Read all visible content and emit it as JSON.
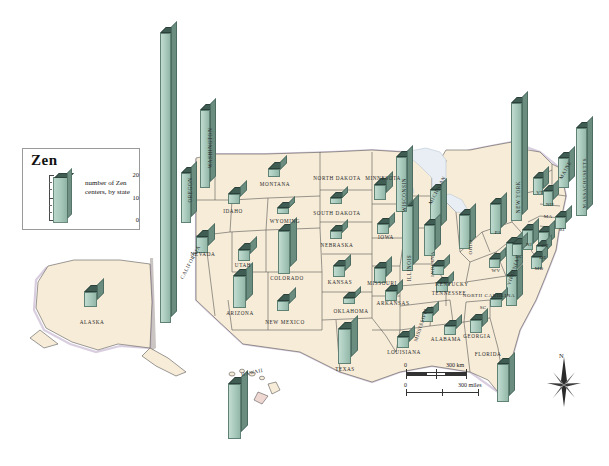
{
  "legend": {
    "title": "Zen",
    "caption": "number of Zen centers, by state",
    "axis_labels": [
      "20",
      "10",
      "0"
    ],
    "axis_max": 20,
    "bar_color": "#a9cbbd",
    "top_color": "#3f5d52"
  },
  "scale": {
    "km_zero": "0",
    "km_label": "300 km",
    "miles_zero": "0",
    "miles_label": "300 miles"
  },
  "compass": {
    "north": "N"
  },
  "chart_data": {
    "type": "bar",
    "title": "Zen",
    "subtitle": "number of Zen centers, by state",
    "ylabel": "number of Zen centers",
    "ylim": [
      0,
      20
    ],
    "categories": [
      "CALIFORNIA",
      "NEW YORK",
      "MASSACHUSETTS",
      "WASHINGTON",
      "OREGON",
      "HAWAII",
      "ILLINOIS",
      "TEXAS",
      "FLORIDA",
      "COLORADO",
      "WISCONSIN",
      "MICHIGAN",
      "PENNSYLVANIA",
      "VIRGINIA",
      "NORTH CAROLINA",
      "ARIZONA",
      "NEW JERSEY",
      "OHIO",
      "MINNESOTA",
      "CONNECTICUT",
      "MAINE",
      "NEVADA",
      "MISSOURI",
      "NEW MEXICO",
      "INDIANA",
      "MARYLAND",
      "LOUISIANA",
      "GEORGIA",
      "ALABAMA",
      "TENNESSEE",
      "KENTUCKY",
      "IOWA",
      "ARKANSAS",
      "MISSISSIPPI",
      "OKLAHOMA",
      "KANSAS",
      "NEBRASKA",
      "SOUTH DAKOTA",
      "MONTANA",
      "IDAHO",
      "UTAH",
      "WYOMING",
      "ALASKA",
      "VERMONT",
      "NEW HAMPSHIRE",
      "RHODE ISLAND",
      "DELAWARE",
      "DISTRICT OF COLUMBIA",
      "WEST VIRGINIA",
      "SOUTH CAROLINA",
      "NORTH DAKOTA"
    ],
    "values": [
      20,
      19,
      16,
      10,
      8,
      12,
      12,
      9,
      8,
      8,
      9,
      7,
      7,
      7,
      7,
      6,
      5,
      5,
      4,
      4,
      5,
      3,
      3,
      2,
      3,
      3,
      3,
      3,
      2,
      2,
      2,
      2,
      2,
      2,
      1,
      2,
      2,
      1,
      1,
      2,
      2,
      1,
      2,
      3,
      3,
      2,
      1,
      2,
      1,
      2,
      0
    ],
    "state_abbrevs": {
      "PENNSYLVANIA": "PA",
      "NEW JERSEY": "NJ",
      "CONNECTICUT": "CT",
      "RHODE ISLAND": "RI",
      "VERMONT": "VT",
      "NEW HAMPSHIRE": "NH",
      "MASSACHUSETTS": "MA",
      "MARYLAND": "MD",
      "DELAWARE": "DE",
      "DISTRICT OF COLUMBIA": "DC",
      "WEST VIRGINIA": "WV",
      "SOUTH CAROLINA": "SC"
    }
  },
  "map": {
    "labels": [
      {
        "name": "WASHINGTON",
        "text": "WASHINGTON",
        "x": 210,
        "y": 148,
        "rot": -90,
        "size": 5.2
      },
      {
        "name": "OREGON",
        "text": "OREGON",
        "x": 190,
        "y": 190,
        "rot": -90,
        "size": 5.2
      },
      {
        "name": "CALIFORNIA",
        "text": "CALIFORNIA",
        "x": 190,
        "y": 262,
        "rot": -62,
        "size": 5.2
      },
      {
        "name": "NEVADA",
        "text": "NEVADA",
        "x": 203,
        "y": 254,
        "rot": 0,
        "size": 5.2
      },
      {
        "name": "IDAHO",
        "text": "IDAHO",
        "x": 233,
        "y": 211,
        "rot": 0,
        "size": 5.2
      },
      {
        "name": "MONTANA",
        "text": "MONTANA",
        "x": 275,
        "y": 184,
        "rot": 0,
        "size": 5.2
      },
      {
        "name": "WYOMING",
        "text": "WYOMING",
        "x": 285,
        "y": 221,
        "rot": 0,
        "size": 5.2
      },
      {
        "name": "UTAH",
        "text": "UTAH",
        "x": 243,
        "y": 265,
        "rot": 0,
        "size": 5.2
      },
      {
        "name": "COLORADO",
        "text": "COLORADO",
        "x": 287,
        "y": 278,
        "rot": 0,
        "size": 5.2
      },
      {
        "name": "ARIZONA",
        "text": "ARIZONA",
        "x": 240,
        "y": 313,
        "rot": 0,
        "size": 5.2
      },
      {
        "name": "NEW-MEXICO",
        "text": "NEW MEXICO",
        "x": 285,
        "y": 322,
        "rot": 0,
        "size": 5.2
      },
      {
        "name": "NORTH-DAKOTA",
        "text": "NORTH DAKOTA",
        "x": 337,
        "y": 178,
        "rot": 0,
        "size": 5.2
      },
      {
        "name": "SOUTH-DAKOTA",
        "text": "SOUTH DAKOTA",
        "x": 337,
        "y": 213,
        "rot": 0,
        "size": 5.2
      },
      {
        "name": "NEBRASKA",
        "text": "NEBRASKA",
        "x": 337,
        "y": 245,
        "rot": 0,
        "size": 5.2
      },
      {
        "name": "KANSAS",
        "text": "KANSAS",
        "x": 340,
        "y": 282,
        "rot": 0,
        "size": 5.2
      },
      {
        "name": "OKLAHOMA",
        "text": "OKLAHOMA",
        "x": 351,
        "y": 311,
        "rot": 0,
        "size": 5.2
      },
      {
        "name": "TEXAS",
        "text": "TEXAS",
        "x": 345,
        "y": 369,
        "rot": 0,
        "size": 5.2
      },
      {
        "name": "MINNESOTA",
        "text": "MINNESOTA",
        "x": 383,
        "y": 178,
        "rot": 0,
        "size": 5.2
      },
      {
        "name": "IOWA",
        "text": "IOWA",
        "x": 386,
        "y": 237,
        "rot": 0,
        "size": 5.2
      },
      {
        "name": "MISSOURI",
        "text": "MISSOURI",
        "x": 382,
        "y": 283,
        "rot": 0,
        "size": 5.2
      },
      {
        "name": "ARKANSAS",
        "text": "ARKANSAS",
        "x": 393,
        "y": 303,
        "rot": 0,
        "size": 5.2
      },
      {
        "name": "LOUISIANA",
        "text": "LOUISIANA",
        "x": 404,
        "y": 352,
        "rot": 0,
        "size": 5.2
      },
      {
        "name": "MISSISSIPPI",
        "text": "MISSISSIPPI",
        "x": 421,
        "y": 325,
        "rot": -72,
        "size": 5
      },
      {
        "name": "ALABAMA",
        "text": "ALABAMA",
        "x": 446,
        "y": 339,
        "rot": 0,
        "size": 5.2
      },
      {
        "name": "GEORGIA",
        "text": "GEORGIA",
        "x": 477,
        "y": 336,
        "rot": 0,
        "size": 5.2
      },
      {
        "name": "FLORIDA",
        "text": "FLORIDA",
        "x": 488,
        "y": 354,
        "rot": 0,
        "size": 5.2
      },
      {
        "name": "TENNESSEE",
        "text": "TENNESSEE",
        "x": 449,
        "y": 293,
        "rot": 0,
        "size": 5.2
      },
      {
        "name": "KENTUCKY",
        "text": "KENTUCKY",
        "x": 452,
        "y": 284,
        "rot": 0,
        "size": 5.2
      },
      {
        "name": "ILLINOIS",
        "text": "ILLINOIS",
        "x": 409,
        "y": 268,
        "rot": -90,
        "size": 5.2
      },
      {
        "name": "WISCONSIN",
        "text": "WISCONSIN",
        "x": 404,
        "y": 195,
        "rot": -90,
        "size": 5.2
      },
      {
        "name": "MICHIGAN",
        "text": "MICHIGAN",
        "x": 437,
        "y": 190,
        "rot": -62,
        "size": 5.2
      },
      {
        "name": "INDIANA",
        "text": "INDIANA",
        "x": 432,
        "y": 264,
        "rot": -90,
        "size": 5
      },
      {
        "name": "OHIO",
        "text": "OHIO",
        "x": 470,
        "y": 247,
        "rot": -90,
        "size": 5
      },
      {
        "name": "NORTH-CAROLINA",
        "text": "NORTH CAROLINA",
        "x": 489,
        "y": 295,
        "rot": 0,
        "size": 5
      },
      {
        "name": "VIRGINIA",
        "text": "VIRGINIA",
        "x": 513,
        "y": 272,
        "rot": -72,
        "size": 5
      },
      {
        "name": "NEW-YORK",
        "text": "NEW YORK",
        "x": 518,
        "y": 197,
        "rot": -90,
        "size": 5.2
      },
      {
        "name": "MAINE",
        "text": "MAINE",
        "x": 565,
        "y": 170,
        "rot": -62,
        "size": 5.2
      },
      {
        "name": "MASSACHUSETTS",
        "text": "MASSACHUSETTS",
        "x": 584,
        "y": 183,
        "rot": -90,
        "size": 5
      },
      {
        "name": "ALASKA",
        "text": "ALASKA",
        "x": 92,
        "y": 322,
        "rot": 0,
        "size": 5.2
      },
      {
        "name": "HAWAII",
        "text": "HAWAII",
        "x": 252,
        "y": 372,
        "rot": -12,
        "size": 5.2
      }
    ],
    "abbrev_labels": [
      {
        "name": "PA",
        "text": "PA",
        "x": 498,
        "y": 232
      },
      {
        "name": "NJ",
        "text": "NJ",
        "x": 529,
        "y": 244
      },
      {
        "name": "CT",
        "text": "CT",
        "x": 545,
        "y": 245
      },
      {
        "name": "RI",
        "text": "RI",
        "x": 562,
        "y": 229
      },
      {
        "name": "VT",
        "text": "VT",
        "x": 540,
        "y": 192
      },
      {
        "name": "NH",
        "text": "NH",
        "x": 550,
        "y": 204
      },
      {
        "name": "MA",
        "text": "MA",
        "x": 548,
        "y": 216
      },
      {
        "name": "MD",
        "text": "MD",
        "x": 539,
        "y": 268
      },
      {
        "name": "DE",
        "text": "DE",
        "x": 543,
        "y": 257
      },
      {
        "name": "DC",
        "text": "DC",
        "x": 519,
        "y": 256
      },
      {
        "name": "WV",
        "text": "WV",
        "x": 496,
        "y": 270
      },
      {
        "name": "SC",
        "text": "SC",
        "x": 483,
        "y": 307
      }
    ],
    "bars": [
      {
        "name": "bar-california",
        "state": "CALIFORNIA",
        "x": 160,
        "y": 33,
        "h": 290,
        "w": 11,
        "d": 6
      },
      {
        "name": "bar-washington",
        "state": "WASHINGTON",
        "x": 200,
        "y": 110,
        "h": 78,
        "w": 10,
        "d": 6
      },
      {
        "name": "bar-oregon",
        "state": "OREGON",
        "x": 181,
        "y": 173,
        "h": 50,
        "w": 10,
        "d": 6
      },
      {
        "name": "bar-nevada",
        "state": "NEVADA",
        "x": 196,
        "y": 237,
        "h": 16,
        "w": 12,
        "d": 7
      },
      {
        "name": "bar-idaho",
        "state": "IDAHO",
        "x": 228,
        "y": 194,
        "h": 10,
        "w": 12,
        "d": 7
      },
      {
        "name": "bar-montana",
        "state": "MONTANA",
        "x": 268,
        "y": 169,
        "h": 8,
        "w": 12,
        "d": 7
      },
      {
        "name": "bar-wyoming",
        "state": "WYOMING",
        "x": 277,
        "y": 208,
        "h": 6,
        "w": 12,
        "d": 6
      },
      {
        "name": "bar-utah",
        "state": "UTAH",
        "x": 238,
        "y": 250,
        "h": 11,
        "w": 12,
        "d": 7
      },
      {
        "name": "bar-colorado",
        "state": "COLORADO",
        "x": 278,
        "y": 231,
        "h": 43,
        "w": 12,
        "d": 7
      },
      {
        "name": "bar-arizona",
        "state": "ARIZONA",
        "x": 233,
        "y": 276,
        "h": 32,
        "w": 13,
        "d": 7
      },
      {
        "name": "bar-newmexico",
        "state": "NEW MEXICO",
        "x": 277,
        "y": 301,
        "h": 10,
        "w": 12,
        "d": 7
      },
      {
        "name": "bar-southdakota",
        "state": "SOUTH DAKOTA",
        "x": 330,
        "y": 198,
        "h": 6,
        "w": 12,
        "d": 6
      },
      {
        "name": "bar-nebraska",
        "state": "NEBRASKA",
        "x": 330,
        "y": 231,
        "h": 8,
        "w": 12,
        "d": 6
      },
      {
        "name": "bar-kansas",
        "state": "KANSAS",
        "x": 333,
        "y": 266,
        "h": 11,
        "w": 12,
        "d": 6
      },
      {
        "name": "bar-oklahoma",
        "state": "OKLAHOMA",
        "x": 343,
        "y": 298,
        "h": 6,
        "w": 12,
        "d": 6
      },
      {
        "name": "bar-texas",
        "state": "TEXAS",
        "x": 338,
        "y": 329,
        "h": 35,
        "w": 13,
        "d": 7
      },
      {
        "name": "bar-minnesota",
        "state": "MINNESOTA",
        "x": 374,
        "y": 185,
        "h": 15,
        "w": 12,
        "d": 7
      },
      {
        "name": "bar-iowa",
        "state": "IOWA",
        "x": 377,
        "y": 224,
        "h": 10,
        "w": 12,
        "d": 6
      },
      {
        "name": "bar-missouri",
        "state": "MISSOURI",
        "x": 374,
        "y": 268,
        "h": 15,
        "w": 12,
        "d": 6
      },
      {
        "name": "bar-arkansas",
        "state": "ARKANSAS",
        "x": 385,
        "y": 291,
        "h": 10,
        "w": 12,
        "d": 6
      },
      {
        "name": "bar-louisiana",
        "state": "LOUISIANA",
        "x": 397,
        "y": 337,
        "h": 11,
        "w": 12,
        "d": 6
      },
      {
        "name": "bar-mississippi",
        "state": "MISSISSIPPI",
        "x": 422,
        "y": 313,
        "h": 9,
        "w": 11,
        "d": 6
      },
      {
        "name": "bar-alabama",
        "state": "ALABAMA",
        "x": 444,
        "y": 326,
        "h": 9,
        "w": 12,
        "d": 6
      },
      {
        "name": "bar-georgia",
        "state": "GEORGIA",
        "x": 470,
        "y": 320,
        "h": 13,
        "w": 12,
        "d": 6
      },
      {
        "name": "bar-florida",
        "state": "FLORIDA",
        "x": 497,
        "y": 364,
        "h": 38,
        "w": 12,
        "d": 6
      },
      {
        "name": "bar-tennessee",
        "state": "TENNESSEE",
        "x": 436,
        "y": 283,
        "h": 9,
        "w": 12,
        "d": 6
      },
      {
        "name": "bar-kentucky",
        "state": "KENTUCKY",
        "x": 432,
        "y": 266,
        "h": 9,
        "w": 12,
        "d": 6
      },
      {
        "name": "bar-illinois",
        "state": "ILLINOIS",
        "x": 402,
        "y": 206,
        "h": 65,
        "w": 11,
        "d": 6
      },
      {
        "name": "bar-wisconsin",
        "state": "WISCONSIN",
        "x": 396,
        "y": 157,
        "h": 55,
        "w": 11,
        "d": 6
      },
      {
        "name": "bar-michigan",
        "state": "MICHIGAN",
        "x": 430,
        "y": 190,
        "h": 42,
        "w": 11,
        "d": 6
      },
      {
        "name": "bar-indiana",
        "state": "INDIANA",
        "x": 424,
        "y": 225,
        "h": 31,
        "w": 11,
        "d": 6
      },
      {
        "name": "bar-ohio",
        "state": "OHIO",
        "x": 459,
        "y": 215,
        "h": 34,
        "w": 11,
        "d": 6
      },
      {
        "name": "bar-pennsylvania",
        "state": "PENNSYLVANIA",
        "x": 490,
        "y": 204,
        "h": 30,
        "w": 11,
        "d": 6
      },
      {
        "name": "bar-virginia",
        "state": "VIRGINIA",
        "x": 506,
        "y": 243,
        "h": 32,
        "w": 11,
        "d": 6
      },
      {
        "name": "bar-northcarolina",
        "state": "NORTH CAROLINA",
        "x": 506,
        "y": 276,
        "h": 30,
        "w": 11,
        "d": 6
      },
      {
        "name": "bar-southcarolina",
        "state": "SOUTH CAROLINA",
        "x": 490,
        "y": 299,
        "h": 8,
        "w": 12,
        "d": 6
      },
      {
        "name": "bar-westvirginia",
        "state": "WEST VIRGINIA",
        "x": 489,
        "y": 259,
        "h": 9,
        "w": 11,
        "d": 6
      },
      {
        "name": "bar-newyork",
        "state": "NEW YORK",
        "x": 511,
        "y": 103,
        "h": 118,
        "w": 11,
        "d": 6
      },
      {
        "name": "bar-vermont",
        "state": "VERMONT",
        "x": 533,
        "y": 178,
        "h": 17,
        "w": 10,
        "d": 6
      },
      {
        "name": "bar-newhampshire",
        "state": "NEW HAMPSHIRE",
        "x": 543,
        "y": 191,
        "h": 15,
        "w": 10,
        "d": 6
      },
      {
        "name": "bar-massachusetts",
        "state": "MASSACHUSETTS",
        "x": 576,
        "y": 128,
        "h": 88,
        "w": 11,
        "d": 6
      },
      {
        "name": "bar-maine",
        "state": "MAINE",
        "x": 558,
        "y": 158,
        "h": 30,
        "w": 11,
        "d": 6
      },
      {
        "name": "bar-rhodeisland",
        "state": "RHODE ISLAND",
        "x": 555,
        "y": 217,
        "h": 12,
        "w": 11,
        "d": 6
      },
      {
        "name": "bar-connecticut",
        "state": "CONNECTICUT",
        "x": 538,
        "y": 232,
        "h": 17,
        "w": 11,
        "d": 6
      },
      {
        "name": "bar-newjersey",
        "state": "NEW JERSEY",
        "x": 522,
        "y": 230,
        "h": 20,
        "w": 11,
        "d": 6
      },
      {
        "name": "bar-delaware",
        "state": "DELAWARE",
        "x": 536,
        "y": 246,
        "h": 11,
        "w": 10,
        "d": 6
      },
      {
        "name": "bar-dc",
        "state": "DISTRICT OF COLUMBIA",
        "x": 512,
        "y": 244,
        "h": 12,
        "w": 10,
        "d": 6
      },
      {
        "name": "bar-maryland",
        "state": "MARYLAND",
        "x": 531,
        "y": 257,
        "h": 12,
        "w": 11,
        "d": 6
      },
      {
        "name": "bar-alaska",
        "state": "ALASKA",
        "x": 84,
        "y": 292,
        "h": 15,
        "w": 13,
        "d": 7
      },
      {
        "name": "bar-hawaii",
        "state": "HAWAII",
        "x": 228,
        "y": 384,
        "h": 55,
        "w": 13,
        "d": 7
      }
    ]
  }
}
